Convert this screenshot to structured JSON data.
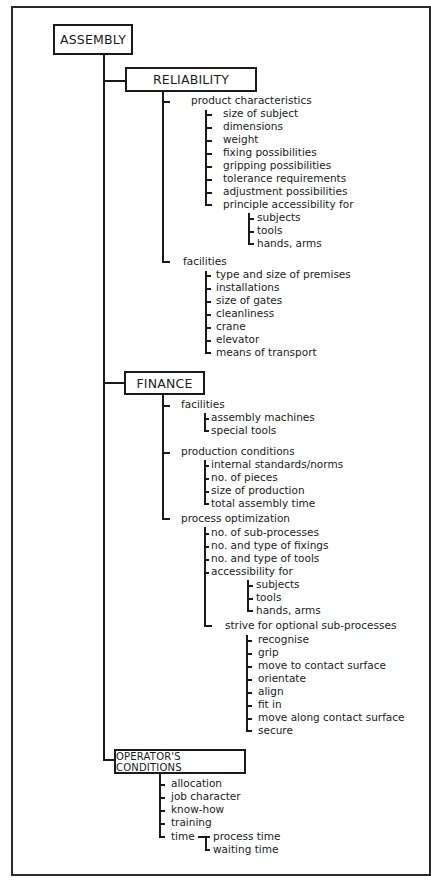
{
  "root": {
    "label": "ASSEMBLY"
  },
  "branches": [
    {
      "label": "RELIABILITY",
      "groups": [
        {
          "label": "product characteristics",
          "items": [
            "size of subject",
            "dimensions",
            "weight",
            "fixing possibilities",
            "gripping possibilities",
            "tolerance requirements",
            "adjustment possibilities",
            "principle accessibility for"
          ],
          "subitems": [
            "subjects",
            "tools",
            "hands, arms"
          ]
        },
        {
          "label": "facilities",
          "items": [
            "type and size of premises",
            "installations",
            "size of gates",
            "cleanliness",
            "crane",
            "elevator",
            "means of transport"
          ]
        }
      ]
    },
    {
      "label": "FINANCE",
      "groups": [
        {
          "label": "facilities",
          "items": [
            "assembly machines",
            "special tools"
          ]
        },
        {
          "label": "production conditions",
          "items": [
            "internal standards/norms",
            "no. of pieces",
            "size of production",
            "total assembly time"
          ]
        },
        {
          "label": "process optimization",
          "items": [
            "no. of sub-processes",
            "no. and type of fixings",
            "no. and type of tools",
            "accessibility for"
          ],
          "subitems": [
            "subjects",
            "tools",
            "hands, arms"
          ],
          "extra_label": "strive for optional sub-processes",
          "extra_items": [
            "recognise",
            "grip",
            "move to contact surface",
            "orientate",
            "align",
            "fit in",
            "move along contact surface",
            "secure"
          ]
        }
      ]
    },
    {
      "label": "OPERATOR'S CONDITIONS",
      "items": [
        "allocation",
        "job character",
        "know-how",
        "training",
        "time"
      ],
      "time_items": [
        "process time",
        "waiting time"
      ]
    }
  ]
}
